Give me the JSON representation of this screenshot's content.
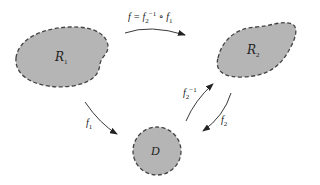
{
  "diagram": {
    "regions": [
      {
        "id": "R1",
        "label": "R",
        "subscript": "1",
        "shape": "blob",
        "fill": "#b5b5b5",
        "stroke": "#444444"
      },
      {
        "id": "R2",
        "label": "R",
        "subscript": "2",
        "shape": "blob",
        "fill": "#b5b5b5",
        "stroke": "#444444"
      },
      {
        "id": "D",
        "label": "D",
        "shape": "disk",
        "fill": "#b5b5b5",
        "stroke": "#444444"
      }
    ],
    "arrows": [
      {
        "id": "f",
        "from": "R1",
        "to": "R2",
        "label_main": "f = f",
        "label_sub": "2",
        "label_sup": "−1",
        "label_tail": " ∘ f",
        "label_tail_sub": "1"
      },
      {
        "id": "f1",
        "from": "R1",
        "to": "D",
        "label": "f",
        "label_sub": "1"
      },
      {
        "id": "f2",
        "from": "R2",
        "to": "D",
        "label": "f",
        "label_sub": "2"
      },
      {
        "id": "f2inv",
        "from": "D",
        "to": "R2",
        "label": "f",
        "label_sub": "2",
        "label_sup": "−1"
      }
    ]
  }
}
